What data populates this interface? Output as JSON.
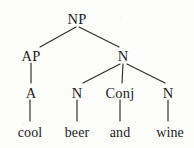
{
  "figure": {
    "kind": "syntax-tree",
    "sentence": "cool beer and wine",
    "ink_color": "#1c1c1c",
    "background_color": "#fdfdfc"
  },
  "nodes": {
    "root": {
      "label": "NP",
      "x": 77,
      "y": 18
    },
    "ap": {
      "label": "AP",
      "x": 31,
      "y": 55
    },
    "n_bar": {
      "label": "N",
      "x": 123,
      "y": 55
    },
    "a": {
      "label": "A",
      "x": 31,
      "y": 92
    },
    "n_beer": {
      "label": "N",
      "x": 77,
      "y": 92
    },
    "conj": {
      "label": "Conj",
      "x": 120,
      "y": 92
    },
    "n_wine": {
      "label": "N",
      "x": 168,
      "y": 92
    }
  },
  "leaves": {
    "cool": {
      "label": "cool",
      "x": 30,
      "y": 133
    },
    "beer": {
      "label": "beer",
      "x": 77,
      "y": 133
    },
    "and": {
      "label": "and",
      "x": 120,
      "y": 133
    },
    "wine": {
      "label": "wine",
      "x": 170,
      "y": 133
    }
  },
  "edges": [
    {
      "name": "np-to-ap",
      "x1": 76,
      "y1": 27,
      "x2": 40,
      "y2": 47
    },
    {
      "name": "np-to-n",
      "x1": 79,
      "y1": 27,
      "x2": 119,
      "y2": 47
    },
    {
      "name": "ap-to-a",
      "x1": 31,
      "y1": 63,
      "x2": 31,
      "y2": 83
    },
    {
      "name": "n-to-n-beer",
      "x1": 120,
      "y1": 64,
      "x2": 83,
      "y2": 83
    },
    {
      "name": "n-to-conj",
      "x1": 123,
      "y1": 64,
      "x2": 122,
      "y2": 83
    },
    {
      "name": "n-to-n-wine",
      "x1": 127,
      "y1": 64,
      "x2": 165,
      "y2": 83
    },
    {
      "name": "a-to-cool",
      "x1": 30,
      "y1": 100,
      "x2": 30,
      "y2": 121
    },
    {
      "name": "n-beer-to-beer",
      "x1": 77,
      "y1": 100,
      "x2": 77,
      "y2": 121
    },
    {
      "name": "conj-to-and",
      "x1": 120,
      "y1": 100,
      "x2": 120,
      "y2": 121
    },
    {
      "name": "n-wine-to-wine",
      "x1": 168,
      "y1": 100,
      "x2": 168,
      "y2": 121
    }
  ]
}
